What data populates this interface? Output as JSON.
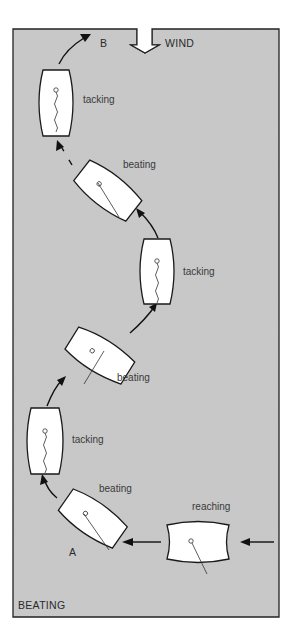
{
  "diagram": {
    "title": "BEATING",
    "wind_label": "WIND",
    "start_label": "A",
    "end_label": "B",
    "colors": {
      "background": "#c9c9c9",
      "border": "#222222",
      "hull": "#ffffff"
    },
    "boats": [
      {
        "id": "reaching",
        "label": "reaching",
        "order": 1
      },
      {
        "id": "beating-1",
        "label": "beating",
        "order": 2
      },
      {
        "id": "tacking-1",
        "label": "tacking",
        "order": 3
      },
      {
        "id": "beating-2",
        "label": "beating",
        "order": 4
      },
      {
        "id": "tacking-2",
        "label": "tacking",
        "order": 5
      },
      {
        "id": "beating-3",
        "label": "beating",
        "order": 6
      },
      {
        "id": "tacking-3",
        "label": "tacking",
        "order": 7
      }
    ]
  }
}
